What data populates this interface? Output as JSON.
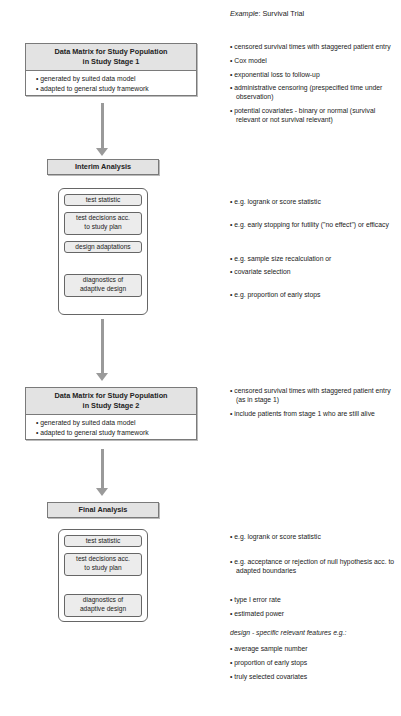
{
  "example_header": {
    "prefix": "Example",
    "suffix": ": Survival Trial"
  },
  "stage1": {
    "title_line1": "Data Matrix for Study Population",
    "title_line2": "in Study Stage 1",
    "bullets": [
      "• generated by suited data model",
      "• adapted to general study framework"
    ]
  },
  "stage1_notes": [
    "• censored survival times with staggered patient entry",
    "• Cox model",
    "• exponential loss to follow-up",
    "• administrative censoring (prespecified time under observation)",
    "• potential covariates  - binary or normal (survival relevant or not survival relevant)"
  ],
  "interim": {
    "title": "Interim Analysis",
    "steps": [
      "test statistic",
      "test decisions acc. to study plan",
      "design adaptations",
      "diagnostics of adaptive design"
    ],
    "notes": [
      "• e.g. logrank or score statistic",
      "• e.g. early stopping for futility (\"no effect\") or efficacy",
      "• e.g. sample size recalculation or",
      "• covariate selection",
      "• e.g. proportion of early stops"
    ]
  },
  "stage2": {
    "title_line1": "Data Matrix for Study Population",
    "title_line2": "in Study Stage 2",
    "bullets": [
      "• generated by suited data model",
      "• adapted to general study framework"
    ]
  },
  "stage2_notes": [
    "• censored survival times with staggered patient entry (as in stage 1)",
    "• include patients from stage 1 who are still alive"
  ],
  "final": {
    "title": "Final Analysis",
    "steps": [
      "test statistic",
      "test decisions acc. to study plan",
      "diagnostics of adaptive design"
    ],
    "notes": [
      "• e.g. logrank or score statistic",
      "• e.g. acceptance or rejection of null hypothesis acc. to adapted boundaries",
      "• type I error rate",
      "• estimated power"
    ],
    "features_heading": "design - specific relevant features e.g.:",
    "features": [
      "• average sample number",
      "• proportion of early stops",
      "• truly selected covariates"
    ]
  }
}
